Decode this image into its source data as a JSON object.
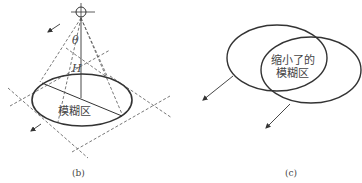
{
  "panel_b": {
    "caption": "(b)",
    "angle_label": "θ",
    "height_label": "H",
    "region_label": "模糊区"
  },
  "panel_c": {
    "caption": "(c)",
    "region_label_line1": "缩小了的",
    "region_label_line2": "模糊区"
  },
  "colors": {
    "stroke": "#333333",
    "dashed": "#555555",
    "text": "#444444"
  }
}
